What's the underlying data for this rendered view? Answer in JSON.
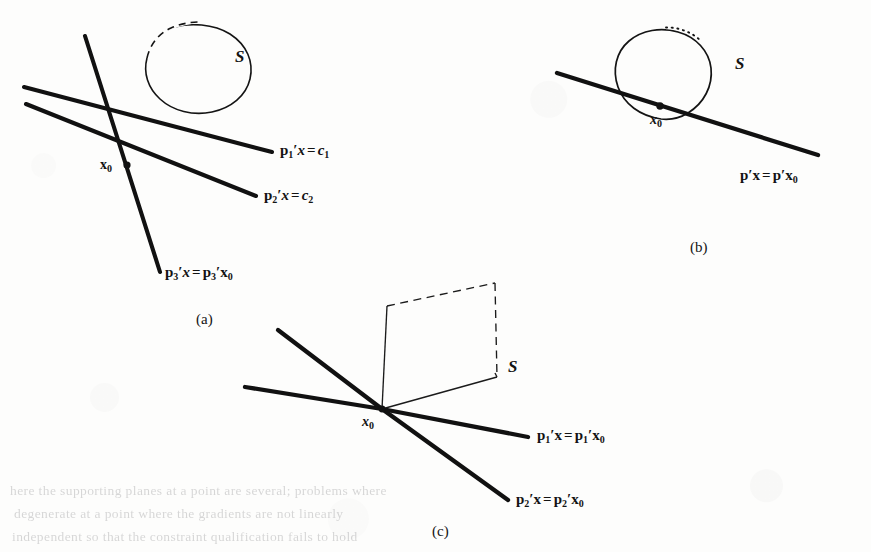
{
  "figure": {
    "ink_color": "#111111",
    "paper_color": "#fdfdfc",
    "ghost_color": "#2a2a2c"
  },
  "panels": [
    {
      "id": "a",
      "caption": "(a)",
      "set_label": "S",
      "point_label": {
        "base": "x",
        "sub": "0"
      },
      "lines": [
        {
          "name": "p1-line",
          "label": {
            "vec": "p",
            "vec_sub": "1",
            "prime": "′",
            "var": "x",
            "op": "=",
            "rhs": "c",
            "rhs_sub": "1",
            "rhs_italic": true
          },
          "plain": "p1′x = c1"
        },
        {
          "name": "p2-line",
          "label": {
            "vec": "p",
            "vec_sub": "2",
            "prime": "′",
            "var": "x",
            "op": "=",
            "rhs": "c",
            "rhs_sub": "2",
            "rhs_italic": true
          },
          "plain": "p2′x = c2"
        },
        {
          "name": "p3-line",
          "label": {
            "vec": "p",
            "vec_sub": "3",
            "prime": "′",
            "var": "x",
            "op": "=",
            "rhs": "p",
            "rhs_sub": "3",
            "rhs_italic": false,
            "rhs_tail_var": "x",
            "rhs_tail_sub": "0"
          },
          "plain": "p3′x = p3′x0"
        }
      ]
    },
    {
      "id": "b",
      "caption": "(b)",
      "set_label": "S",
      "point_label": {
        "base": "x",
        "sub": "0"
      },
      "lines": [
        {
          "name": "p-tangent-line",
          "label": {
            "vec": "p",
            "vec_sub": "",
            "prime": "′",
            "var": "x",
            "op": "=",
            "rhs": "p",
            "rhs_sub": "",
            "rhs_italic": false,
            "rhs_tail_var": "x",
            "rhs_tail_sub": "0"
          },
          "plain": "p′x = p′x0"
        }
      ]
    },
    {
      "id": "c",
      "caption": "(c)",
      "set_label": "S",
      "point_label": {
        "base": "x",
        "sub": "0"
      },
      "lines": [
        {
          "name": "p1-line",
          "label": {
            "vec": "p",
            "vec_sub": "1",
            "prime": "′",
            "var": "x",
            "op": "=",
            "rhs": "p",
            "rhs_sub": "1",
            "rhs_italic": false,
            "rhs_tail_var": "x",
            "rhs_tail_sub": "0"
          },
          "plain": "p1′x = p1′x0"
        },
        {
          "name": "p2-line",
          "label": {
            "vec": "p",
            "vec_sub": "2",
            "prime": "′",
            "var": "x",
            "op": "=",
            "rhs": "p",
            "rhs_sub": "2",
            "rhs_italic": false,
            "rhs_tail_var": "x",
            "rhs_tail_sub": "0"
          },
          "plain": "p2′x = p2′x0"
        }
      ]
    }
  ],
  "bleed_through": {
    "note": "faint mirrored text showing through from the reverse side of the scanned page",
    "rows": [
      "here the supporting planes at a point are several; problems where",
      "degenerate at a point where the gradients are not linearly",
      "independent so that the constraint qualification fails to hold"
    ]
  }
}
